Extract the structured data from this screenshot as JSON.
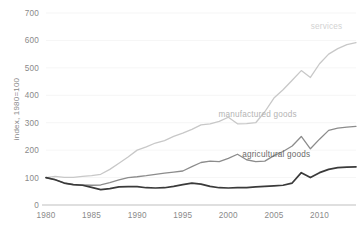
{
  "chart_data": {
    "type": "line",
    "title": "",
    "subtitle": "",
    "xlabel": "",
    "ylabel": "index, 1980=100",
    "xlim": [
      1980,
      2014
    ],
    "ylim": [
      0,
      700
    ],
    "grid": true,
    "legend_position": "inline-end-of-line",
    "x_ticks": [
      "1980",
      "1985",
      "1990",
      "1995",
      "2000",
      "2005",
      "2010"
    ],
    "x_tick_values": [
      1980,
      1985,
      1990,
      1995,
      2000,
      2005,
      2010
    ],
    "y_ticks": [
      "0",
      "100",
      "200",
      "300",
      "400",
      "500",
      "600",
      "700"
    ],
    "y_tick_values": [
      0,
      100,
      200,
      300,
      400,
      500,
      600,
      700
    ],
    "x": [
      1980,
      1981,
      1982,
      1983,
      1984,
      1985,
      1986,
      1987,
      1988,
      1989,
      1990,
      1991,
      1992,
      1993,
      1994,
      1995,
      1996,
      1997,
      1998,
      1999,
      2000,
      2001,
      2002,
      2003,
      2004,
      2005,
      2006,
      2007,
      2008,
      2009,
      2010,
      2011,
      2012,
      2013,
      2014
    ],
    "series": [
      {
        "name": "services",
        "label": "services",
        "color": "#c8c8c8",
        "stroke_width": 1.3,
        "values": [
          100,
          104,
          101,
          101,
          104,
          107,
          112,
          130,
          152,
          175,
          200,
          212,
          226,
          235,
          250,
          262,
          276,
          292,
          296,
          305,
          320,
          296,
          297,
          300,
          340,
          390,
          420,
          455,
          490,
          465,
          515,
          550,
          570,
          585,
          592
        ]
      },
      {
        "name": "manufactured goods",
        "label": "manufactured goods",
        "color": "#8c8c8c",
        "stroke_width": 1.3,
        "values": [
          100,
          93,
          80,
          74,
          73,
          72,
          73,
          82,
          92,
          100,
          103,
          107,
          112,
          116,
          120,
          124,
          140,
          155,
          160,
          158,
          170,
          185,
          165,
          158,
          160,
          180,
          195,
          215,
          250,
          205,
          240,
          272,
          280,
          284,
          287
        ]
      },
      {
        "name": "agricultural goods",
        "label": "agricultural goods",
        "color": "#3a3a3a",
        "stroke_width": 1.7,
        "values": [
          100,
          92,
          80,
          74,
          72,
          64,
          56,
          60,
          66,
          67,
          67,
          63,
          62,
          63,
          68,
          74,
          80,
          76,
          68,
          63,
          62,
          63,
          63,
          66,
          68,
          70,
          72,
          80,
          118,
          100,
          118,
          130,
          136,
          138,
          139
        ]
      }
    ],
    "annotations": [
      {
        "text": "services",
        "x": 2012.5,
        "y": 640,
        "color": "#d2d2d2"
      },
      {
        "text": "manufactured goods",
        "x": 2007.5,
        "y": 320,
        "color": "#b4b4b4"
      },
      {
        "text": "agricultural goods",
        "x": 2009.0,
        "y": 175,
        "color": "#6a6a6a"
      }
    ],
    "colors": {
      "background": "#ffffff",
      "gridline": "#f0f0f0",
      "axis": "#bfbfbf",
      "tick_text": "#8a8a8a"
    }
  }
}
